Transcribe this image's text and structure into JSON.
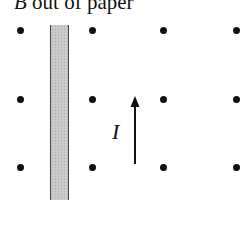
{
  "diagram": {
    "title_symbol": "B",
    "title_rest": " out of paper",
    "current_label": "I",
    "dots": [
      {
        "x": 20,
        "y": 30
      },
      {
        "x": 92,
        "y": 30
      },
      {
        "x": 163,
        "y": 30
      },
      {
        "x": 236,
        "y": 30
      },
      {
        "x": 20,
        "y": 99
      },
      {
        "x": 92,
        "y": 99
      },
      {
        "x": 163,
        "y": 99
      },
      {
        "x": 236,
        "y": 99
      },
      {
        "x": 20,
        "y": 167
      },
      {
        "x": 92,
        "y": 167
      },
      {
        "x": 163,
        "y": 167
      },
      {
        "x": 236,
        "y": 167
      }
    ],
    "strip_color": "#c9c9c9",
    "ink_color": "#111111"
  }
}
